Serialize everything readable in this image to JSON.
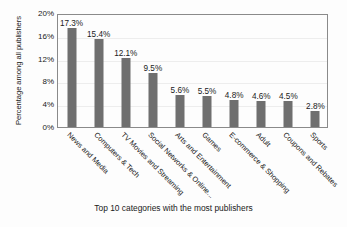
{
  "chart_data": {
    "type": "bar",
    "title": "",
    "xlabel": "Top 10 categories with the most publishers",
    "ylabel": "Percentage among all publishers",
    "categories": [
      "News and Media",
      "Computers & Tech",
      "TV Movies and Streaming",
      "Social Networks & Online...",
      "Arts and Entertainment",
      "Games",
      "E-commerce & Shopping",
      "Adult",
      "Coupons and Rebates",
      "Sports"
    ],
    "values": [
      17.3,
      15.4,
      12.1,
      9.5,
      5.6,
      5.5,
      4.8,
      4.6,
      4.5,
      2.8
    ],
    "value_labels": [
      "17.3%",
      "15.4%",
      "12.1%",
      "9.5%",
      "5.6%",
      "5.5%",
      "4.8%",
      "4.6%",
      "4.5%",
      "2.8%"
    ],
    "ylim": [
      0,
      20
    ],
    "ytick_values": [
      0,
      4,
      8,
      12,
      16,
      20
    ],
    "ytick_labels": [
      "0%",
      "4%",
      "8%",
      "12%",
      "16%",
      "20%"
    ],
    "grid": true,
    "legend": false,
    "bar_color": "#6f6f6f",
    "frame_color": "#8a8a8a",
    "gridline_color": "#ededed",
    "background_color": "#fdfdfd"
  }
}
